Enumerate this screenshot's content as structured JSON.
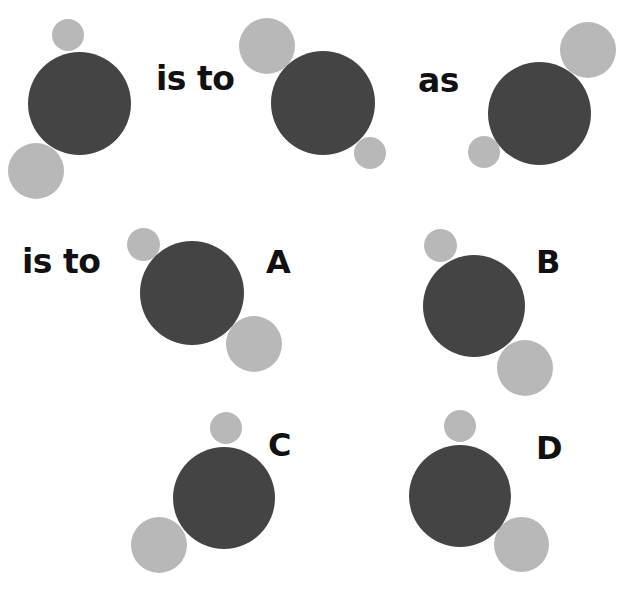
{
  "colors": {
    "dark": "#444444",
    "light": "#b8b8b8",
    "text": "#111111",
    "background": "#ffffff"
  },
  "words": [
    {
      "id": "is-to-1",
      "text": "is to",
      "x": 156,
      "y": 62
    },
    {
      "id": "as",
      "text": "as",
      "x": 418,
      "y": 64
    },
    {
      "id": "is-to-2",
      "text": "is to",
      "x": 22,
      "y": 245
    }
  ],
  "options": [
    {
      "id": "A",
      "label": "A",
      "x": 266,
      "y": 246
    },
    {
      "id": "B",
      "label": "B",
      "x": 536,
      "y": 246
    },
    {
      "id": "C",
      "label": "C",
      "x": 268,
      "y": 429
    },
    {
      "id": "D",
      "label": "D",
      "x": 536,
      "y": 432
    }
  ],
  "figures": [
    {
      "id": "figure-1",
      "role": "premise",
      "circles": [
        {
          "kind": "dark",
          "cx": 79.5,
          "cy": 103,
          "r": 51.5
        },
        {
          "kind": "light",
          "cx": 68,
          "cy": 35,
          "r": 16
        },
        {
          "kind": "light",
          "cx": 36,
          "cy": 171,
          "r": 28
        }
      ]
    },
    {
      "id": "figure-2",
      "role": "premise",
      "circles": [
        {
          "kind": "dark",
          "cx": 323,
          "cy": 103,
          "r": 52
        },
        {
          "kind": "light",
          "cx": 267,
          "cy": 45.5,
          "r": 28
        },
        {
          "kind": "light",
          "cx": 370,
          "cy": 152.5,
          "r": 16
        }
      ]
    },
    {
      "id": "figure-3",
      "role": "premise",
      "circles": [
        {
          "kind": "dark",
          "cx": 539.5,
          "cy": 113,
          "r": 51.5
        },
        {
          "kind": "light",
          "cx": 588,
          "cy": 49.5,
          "r": 28
        },
        {
          "kind": "light",
          "cx": 484,
          "cy": 151.5,
          "r": 16
        }
      ]
    },
    {
      "id": "option-a",
      "role": "answer",
      "circles": [
        {
          "kind": "dark",
          "cx": 192,
          "cy": 292.5,
          "r": 52
        },
        {
          "kind": "light",
          "cx": 143.5,
          "cy": 244,
          "r": 16.5
        },
        {
          "kind": "light",
          "cx": 254,
          "cy": 343.5,
          "r": 28
        }
      ]
    },
    {
      "id": "option-b",
      "role": "answer",
      "circles": [
        {
          "kind": "dark",
          "cx": 474,
          "cy": 306,
          "r": 51
        },
        {
          "kind": "light",
          "cx": 440.5,
          "cy": 245,
          "r": 16.5
        },
        {
          "kind": "light",
          "cx": 525,
          "cy": 367.5,
          "r": 28
        }
      ]
    },
    {
      "id": "option-c",
      "role": "answer",
      "circles": [
        {
          "kind": "dark",
          "cx": 224,
          "cy": 498,
          "r": 51
        },
        {
          "kind": "light",
          "cx": 225.5,
          "cy": 428,
          "r": 16
        },
        {
          "kind": "light",
          "cx": 159,
          "cy": 544.5,
          "r": 28
        }
      ]
    },
    {
      "id": "option-d",
      "role": "answer",
      "circles": [
        {
          "kind": "dark",
          "cx": 460,
          "cy": 495.5,
          "r": 51
        },
        {
          "kind": "light",
          "cx": 460,
          "cy": 425.5,
          "r": 16
        },
        {
          "kind": "light",
          "cx": 521.5,
          "cy": 544.5,
          "r": 27.5
        }
      ]
    }
  ]
}
